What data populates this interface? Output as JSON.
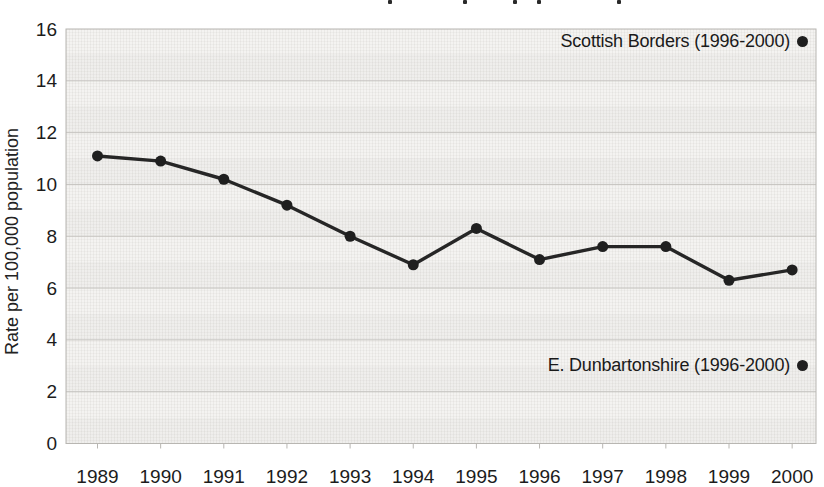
{
  "chart_data": {
    "type": "line",
    "title": "",
    "title_cropped_at_top": true,
    "ylabel": "Rate per 100,000 population",
    "xlabel": "",
    "ylim": [
      0,
      16
    ],
    "yticks": [
      0,
      2,
      4,
      6,
      8,
      10,
      12,
      14,
      16
    ],
    "grid": "horizontal",
    "legend_position": "none",
    "categories": [
      "1989",
      "1990",
      "1991",
      "1992",
      "1993",
      "1994",
      "1995",
      "1996",
      "1997",
      "1998",
      "1999",
      "2000"
    ],
    "series": [
      {
        "name": "Rate per 100,000 population",
        "values": [
          11.1,
          10.9,
          10.2,
          9.2,
          8.0,
          6.9,
          8.3,
          7.1,
          7.6,
          7.6,
          6.3,
          6.7
        ]
      }
    ],
    "annotations": [
      {
        "label": "Scottish Borders (1996-2000)",
        "marker": "dot",
        "y_value": 15.5
      },
      {
        "label": "E. Dunbartonshire (1996-2000)",
        "marker": "dot",
        "y_value": 3.0
      }
    ],
    "cropped_title_descender_x": [
      388,
      463,
      513,
      537,
      617
    ],
    "colors": {
      "line": "#262626",
      "marker": "#1f1f1f",
      "grid": "#c6c4c0",
      "plot_border": "#b8b6b2",
      "plot_background": "#f4f3f1",
      "text": "#1c1c1c",
      "page_background": "#ffffff"
    }
  }
}
